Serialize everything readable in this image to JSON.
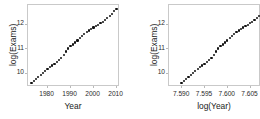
{
  "figure": {
    "background": "#ffffff",
    "point_color": "#111111",
    "frame_color": "#c9c9c9",
    "text_color": "#1a1a1a"
  },
  "chart_data": [
    {
      "type": "scatter",
      "title": "",
      "xlabel": "Year",
      "ylabel": "log(Exams)",
      "xlim": [
        1971.5,
        2011.5
      ],
      "ylim": [
        9.45,
        12.8
      ],
      "xticks": [
        1980,
        1990,
        2000,
        2010
      ],
      "xticklabels": [
        "1980",
        "1990",
        "2000",
        "2010"
      ],
      "yticks": [
        10,
        11,
        12
      ],
      "yticklabels": [
        "10",
        "11",
        "12"
      ],
      "grid": false,
      "legend": "none",
      "x": [
        1973,
        1974,
        1975,
        1976,
        1977,
        1978,
        1979,
        1980,
        1981,
        1982,
        1983,
        1984,
        1985,
        1986,
        1987,
        1988,
        1989,
        1990,
        1991,
        1992,
        1993,
        1994,
        1995,
        1996,
        1997,
        1998,
        1999,
        2000,
        2001,
        2002,
        2003,
        2004,
        2005,
        2006,
        2007,
        2008,
        2009,
        2010
      ],
      "y": [
        9.62,
        9.7,
        9.78,
        9.86,
        9.94,
        10.02,
        10.1,
        10.19,
        10.27,
        10.33,
        10.39,
        10.47,
        10.55,
        10.64,
        10.76,
        10.9,
        11.02,
        11.11,
        11.19,
        11.27,
        11.35,
        11.44,
        11.53,
        11.62,
        11.7,
        11.76,
        11.82,
        11.88,
        11.94,
        11.99,
        12.05,
        12.12,
        12.19,
        12.27,
        12.35,
        12.44,
        12.54,
        12.64
      ]
    },
    {
      "type": "scatter",
      "title": "",
      "xlabel": "log(Year)",
      "ylabel": "log(Exams)",
      "xlim": [
        7.5871,
        7.6073
      ],
      "ylim": [
        9.45,
        12.8
      ],
      "xticks": [
        7.59,
        7.595,
        7.6,
        7.605
      ],
      "xticklabels": [
        "7.590",
        "7.595",
        "7.600",
        "7.605"
      ],
      "yticks": [
        10,
        11,
        12
      ],
      "yticklabels": [
        "10",
        "11",
        "12"
      ],
      "grid": false,
      "legend": "none",
      "x": [
        7.58985,
        7.59036,
        7.59087,
        7.59137,
        7.59188,
        7.59239,
        7.59289,
        7.5934,
        7.5939,
        7.59441,
        7.59491,
        7.59541,
        7.59591,
        7.59642,
        7.59692,
        7.59742,
        7.59792,
        7.59842,
        7.59892,
        7.59942,
        7.59992,
        7.60042,
        7.60091,
        7.60141,
        7.60191,
        7.60241,
        7.6029,
        7.6034,
        7.60389,
        7.60439,
        7.60489,
        7.60538,
        7.60587,
        7.60637,
        7.60686,
        7.60736,
        7.60785,
        7.60834
      ],
      "y": [
        9.62,
        9.7,
        9.78,
        9.86,
        9.94,
        10.02,
        10.1,
        10.19,
        10.27,
        10.33,
        10.39,
        10.47,
        10.55,
        10.64,
        10.76,
        10.9,
        11.02,
        11.11,
        11.19,
        11.27,
        11.35,
        11.44,
        11.53,
        11.62,
        11.7,
        11.76,
        11.82,
        11.88,
        11.94,
        11.99,
        12.05,
        12.12,
        12.19,
        12.27,
        12.35,
        12.44,
        12.54,
        12.64
      ]
    }
  ]
}
